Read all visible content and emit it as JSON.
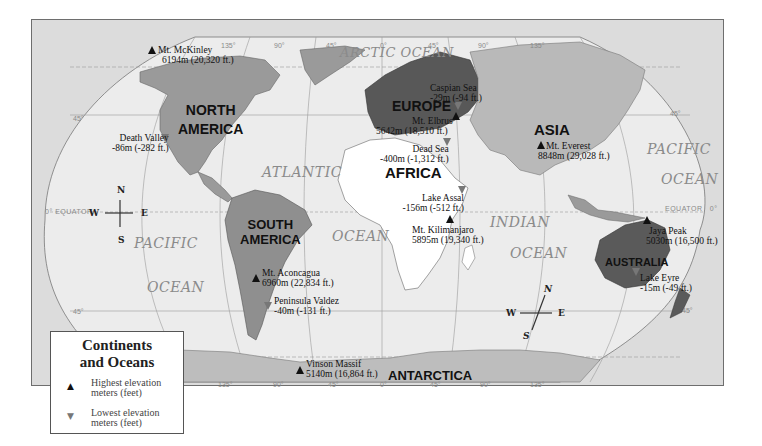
{
  "map": {
    "title": "Continents and Oceans",
    "colors": {
      "frame_bg": "#dcdcdc",
      "ocean": "#ececec",
      "north_america": "#9a9a9a",
      "south_america": "#8f8f8f",
      "europe": "#585858",
      "asia": "#b9b9b9",
      "africa": "#ffffff",
      "australia": "#5a5a5a",
      "antarctica": "#bdbdbd",
      "highest_marker": "#111111",
      "lowest_marker": "#777777"
    },
    "continents": [
      {
        "id": "north-america",
        "name_line1": "NORTH",
        "name_line2": "AMERICA"
      },
      {
        "id": "south-america",
        "name_line1": "SOUTH",
        "name_line2": "AMERICA"
      },
      {
        "id": "europe",
        "name_line1": "EUROPE"
      },
      {
        "id": "asia",
        "name_line1": "ASIA"
      },
      {
        "id": "africa",
        "name_line1": "AFRICA"
      },
      {
        "id": "australia",
        "name_line1": "AUSTRALIA"
      },
      {
        "id": "antarctica",
        "name_line1": "ANTARCTICA"
      }
    ],
    "oceans": {
      "arctic": "ARCTIC OCEAN",
      "atlantic_1": "ATLANTIC",
      "atlantic_2": "OCEAN",
      "pacific_west_1": "PACIFIC",
      "pacific_west_2": "OCEAN",
      "pacific_east_1": "PACIFIC",
      "pacific_east_2": "OCEAN",
      "indian_1": "INDIAN",
      "indian_2": "OCEAN"
    },
    "features": [
      {
        "id": "mt-mckinley",
        "type": "highest",
        "name": "Mt. McKinley",
        "elevation": "6194m (20,320 ft.)"
      },
      {
        "id": "death-valley",
        "type": "lowest",
        "name": "Death Valley",
        "elevation": "-86m (-282 ft.)"
      },
      {
        "id": "caspian-sea",
        "type": "lowest",
        "name": "Caspian Sea",
        "elevation": "-29m (-94 ft.)"
      },
      {
        "id": "mt-elbrus",
        "type": "highest",
        "name": "Mt. Elbrus",
        "elevation": "5642m (18,510 ft.)"
      },
      {
        "id": "dead-sea",
        "type": "lowest",
        "name": "Dead Sea",
        "elevation": "-400m (-1,312 ft.)"
      },
      {
        "id": "mt-everest",
        "type": "highest",
        "name": "Mt. Everest",
        "elevation": "8848m (29,028 ft.)"
      },
      {
        "id": "lake-assal",
        "type": "lowest",
        "name": "Lake Assal",
        "elevation": "-156m (-512 ft.)"
      },
      {
        "id": "mt-kilimanjaro",
        "type": "highest",
        "name": "Mt. Kilimanjaro",
        "elevation": "5895m (19,340 ft.)"
      },
      {
        "id": "jaya-peak",
        "type": "highest",
        "name": "Jaya Peak",
        "elevation": "5030m (16,500 ft.)"
      },
      {
        "id": "lake-eyre",
        "type": "lowest",
        "name": "Lake Eyre",
        "elevation": "-15m (-49 ft.)"
      },
      {
        "id": "mt-aconcagua",
        "type": "highest",
        "name": "Mt. Aconcagua",
        "elevation": "6960m (22,834 ft.)"
      },
      {
        "id": "peninsula-valdez",
        "type": "lowest",
        "name": "Peninsula Valdez",
        "elevation": "-40m (-131 ft.)"
      },
      {
        "id": "vinson-massif",
        "type": "highest",
        "name": "Vinson Massif",
        "elevation": "5140m (16,864 ft.)"
      }
    ],
    "graticule": {
      "equator_label": "EQUATOR",
      "equator_deg_left": "0°",
      "equator_deg_right": "0°",
      "lat_north": "45°",
      "lat_south": "45°",
      "top_longitudes": [
        "135°",
        "90°",
        "45°",
        "0°",
        "45°",
        "90°",
        "135°"
      ],
      "bottom_longitudes": [
        "135°",
        "90°",
        "45°",
        "0°",
        "45°",
        "90°",
        "135°"
      ]
    },
    "compass_west": {
      "n": "N",
      "s": "S",
      "e": "E",
      "w": "W"
    },
    "compass_east": {
      "n": "N",
      "s": "S",
      "e": "E",
      "w": "W"
    }
  },
  "legend": {
    "title_line1": "Continents",
    "title_line2": "and Oceans",
    "items": [
      {
        "symbol": "▲",
        "type": "highest",
        "line1": "Highest elevation",
        "line2": "meters (feet)"
      },
      {
        "symbol": "▼",
        "type": "lowest",
        "line1": "Lowest elevation",
        "line2": "meters (feet)"
      }
    ]
  }
}
